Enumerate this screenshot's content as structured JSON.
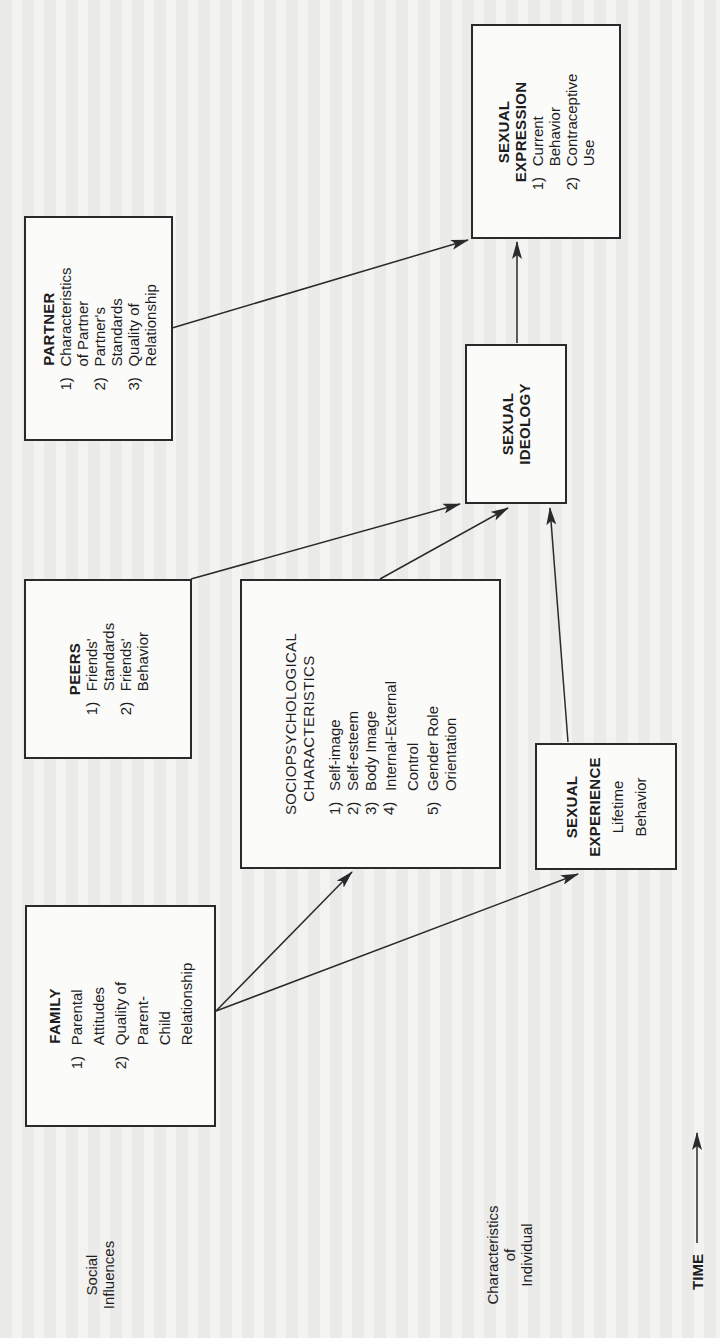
{
  "diagram": {
    "orientation": "rotated-90-ccw",
    "boxes": {
      "partner": {
        "title": "PARTNER",
        "items": [
          {
            "num": "1)",
            "text": "Characteristics\nof Partner"
          },
          {
            "num": "2)",
            "text": "Partner's\nStandards"
          },
          {
            "num": "3)",
            "text": "Quality of\nRelationship"
          }
        ]
      },
      "sexual_expression": {
        "title": "SEXUAL\nEXPRESSION",
        "items": [
          {
            "num": "1)",
            "text": "Current\nBehavior"
          },
          {
            "num": "2)",
            "text": "Contraceptive\nUse"
          }
        ]
      },
      "sexual_ideology": {
        "title": "SEXUAL\nIDEOLOGY"
      },
      "peers": {
        "title": "PEERS",
        "items": [
          {
            "num": "1)",
            "text": "Friends'\nStandards"
          },
          {
            "num": "2)",
            "text": "Friends'\nBehavior"
          }
        ]
      },
      "sociopsychological": {
        "title": "SOCIOPSYCHOLOGICAL\n   CHARACTERISTICS",
        "items": [
          {
            "num": "1)",
            "text": "Self-image"
          },
          {
            "num": "2)",
            "text": "Self-esteem"
          },
          {
            "num": "3)",
            "text": "Body Image"
          },
          {
            "num": "4)",
            "text": "Internal-External\nControl"
          },
          {
            "num": "5)",
            "text": "Gender Role\nOrientation"
          }
        ]
      },
      "sexual_experience": {
        "title": "SEXUAL\nEXPERIENCE",
        "subtitle": "Lifetime\nBehavior"
      },
      "family": {
        "title": "FAMILY",
        "items": [
          {
            "num": "1)",
            "text": "Parental\nAttitudes"
          },
          {
            "num": "2)",
            "text": "Quality of\nParent-Child\nRelationship"
          }
        ]
      }
    },
    "row_labels": {
      "social_influences": "Social\nInfluences",
      "characteristics_of_individual": "Characteristics\nof\nIndividual",
      "time": "TIME"
    },
    "arrows": [
      {
        "from": "family",
        "to": "sociopsychological"
      },
      {
        "from": "family",
        "to": "sexual_experience"
      },
      {
        "from": "peers",
        "to": "sexual_ideology"
      },
      {
        "from": "sociopsychological",
        "to": "sexual_ideology"
      },
      {
        "from": "sexual_experience",
        "to": "sexual_ideology"
      },
      {
        "from": "sexual_ideology",
        "to": "sexual_expression"
      },
      {
        "from": "partner",
        "to": "sexual_expression"
      }
    ],
    "colors": {
      "line": "#2a2a2a",
      "paper": "#f3f3f1"
    }
  }
}
